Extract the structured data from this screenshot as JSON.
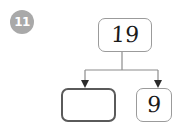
{
  "exercise": {
    "number_badge": "11",
    "badge_color": "#a9a9a9",
    "badge_text_color": "#ffffff"
  },
  "diagram": {
    "type": "part-part-whole-number-bond",
    "whole": {
      "label": "whole-box",
      "value": "19",
      "filled": true,
      "border_color": "#9b9b9b"
    },
    "parts": [
      {
        "label": "part-box-left",
        "value": "",
        "filled": false,
        "border_color": "#5a5a5a",
        "emphasis": "answer-blank"
      },
      {
        "label": "part-box-right",
        "value": "9",
        "filled": true,
        "border_color": "#9b9b9b"
      }
    ],
    "connector_color": "#8c8c8c",
    "arrowhead_color": "#2b2b2b"
  }
}
